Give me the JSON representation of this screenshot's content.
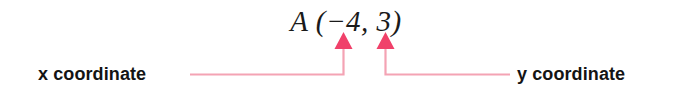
{
  "figure": {
    "name": "ordered-pair-coordinate-callout",
    "background_color": "#ffffff"
  },
  "notation": {
    "text": "A (−4, 3)",
    "point_label": "A",
    "x_value": "−4",
    "y_value": "3",
    "color": "#1a1a1a"
  },
  "callouts": {
    "x": {
      "label": "x coordinate",
      "points_to": "x_value"
    },
    "y": {
      "label": "y coordinate",
      "points_to": "y_value"
    }
  },
  "leaders": {
    "color": "#f2607a",
    "line_color": "#f4a3b4",
    "arrow_color": "#f0416a"
  }
}
